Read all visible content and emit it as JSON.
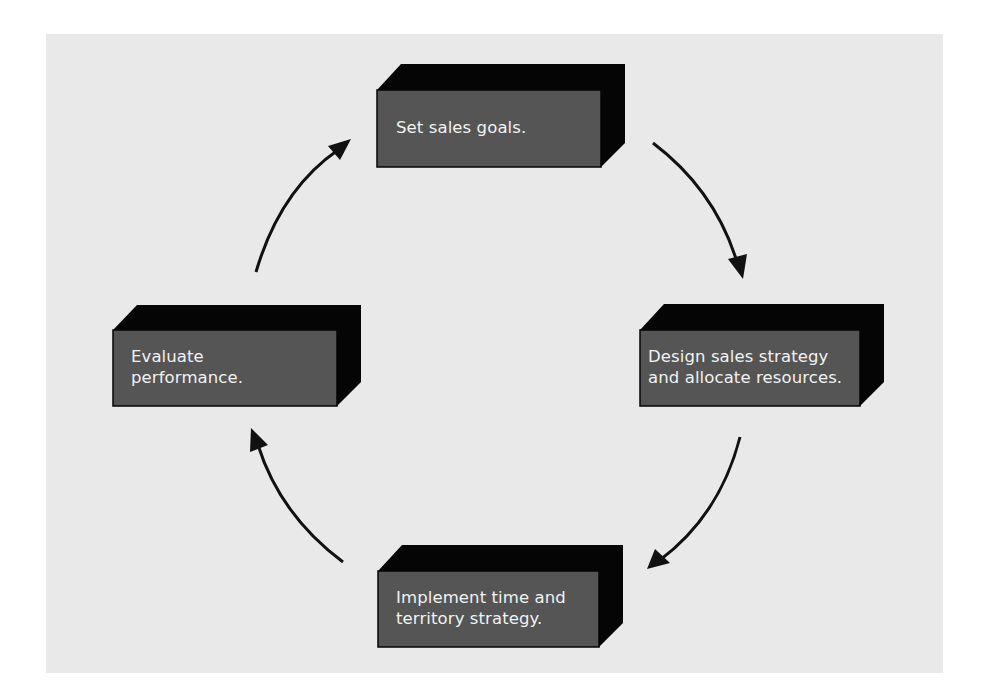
{
  "diagram": {
    "type": "cycle",
    "colors": {
      "background": "#e9e9e9",
      "box_front": "#555555",
      "box_extrude": "#050505",
      "text": "#f2f2f2",
      "arrow": "#111111"
    },
    "steps": [
      {
        "id": "set-goals",
        "line1": "Set sales goals.",
        "line2": ""
      },
      {
        "id": "design-strategy",
        "line1": "Design sales strategy",
        "line2": "and allocate resources."
      },
      {
        "id": "implement",
        "line1": "Implement time and",
        "line2": "territory strategy."
      },
      {
        "id": "evaluate",
        "line1": "Evaluate",
        "line2": "performance."
      }
    ],
    "arrows": [
      {
        "from": "set-goals",
        "to": "design-strategy"
      },
      {
        "from": "design-strategy",
        "to": "implement"
      },
      {
        "from": "implement",
        "to": "evaluate"
      },
      {
        "from": "evaluate",
        "to": "set-goals"
      }
    ]
  }
}
